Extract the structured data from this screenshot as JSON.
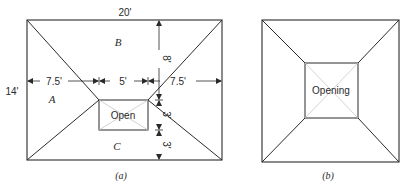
{
  "figure_a": {
    "caption": "(a)",
    "width_label": "20'",
    "height_label": "14'",
    "region_labels": {
      "top": "B",
      "left": "A",
      "bottom": "C"
    },
    "opening_label": "Open",
    "horizontal_dims": [
      "7.5'",
      "5'",
      "7.5'"
    ],
    "vertical_dims": [
      "8'",
      "3'",
      "3'"
    ]
  },
  "figure_b": {
    "caption": "(b)",
    "opening_label": "Opening"
  },
  "colors": {
    "ink": "#2a2a2a",
    "opening_diagonals": "#c8c8c8",
    "background": "#ffffff"
  }
}
